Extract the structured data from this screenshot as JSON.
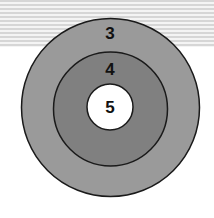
{
  "diagram": {
    "type": "concentric-target",
    "rings": [
      {
        "label": "3",
        "color": "#9a9a9a",
        "cx": 110.5,
        "cy": 107.5,
        "r": 89
      },
      {
        "label": "4",
        "color": "#7f7f7f",
        "cx": 110.5,
        "cy": 109,
        "r": 57
      },
      {
        "label": "5",
        "color": "#ffffff",
        "cx": 110,
        "cy": 107,
        "r": 23
      }
    ],
    "background": {
      "striped_band_height": 47,
      "stripe_color": "#d6d6d6"
    }
  }
}
